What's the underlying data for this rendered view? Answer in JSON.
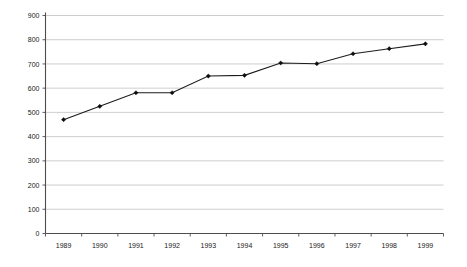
{
  "chart_data": {
    "type": "line",
    "title": "",
    "subtitle": "",
    "xlabel": "",
    "ylabel": "",
    "categories": [
      "1989",
      "1990",
      "1991",
      "1992",
      "1993",
      "1994",
      "1995",
      "1996",
      "1997",
      "1998",
      "1999"
    ],
    "values": [
      470,
      525,
      581,
      581,
      650,
      653,
      704,
      701,
      742,
      763,
      783
    ],
    "series": [
      {
        "name": "Series 1",
        "values": [
          470,
          525,
          581,
          581,
          650,
          653,
          704,
          701,
          742,
          763,
          783
        ]
      }
    ],
    "ylim": [
      0,
      900
    ],
    "ytick_step": 100,
    "yticks": [
      0,
      100,
      200,
      300,
      400,
      500,
      600,
      700,
      800,
      900
    ],
    "ytick_labels": [
      "0",
      "100",
      "200",
      "300",
      "400",
      "500",
      "600",
      "700",
      "800",
      "900"
    ],
    "xtick_labels": [
      "1989",
      "1990",
      "1991",
      "1992",
      "1993",
      "1994",
      "1995",
      "1996",
      "1997",
      "1998",
      "1999"
    ],
    "grid": "horizontal",
    "legend": "none",
    "legend_position": "none",
    "marker": "diamond",
    "line_color": "#1c1c1c",
    "marker_color": "#0d0d0d",
    "gridline_color": "#b9b9b9",
    "axis_color": "#4d4d4d",
    "background_color": "#ffffff",
    "annotations": []
  },
  "figure": {
    "caption_ghost": ""
  }
}
